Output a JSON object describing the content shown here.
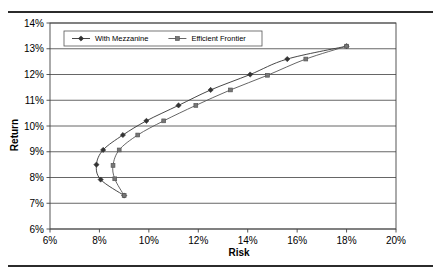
{
  "figure": {
    "has_top_rule": true,
    "has_bottom_rule": true,
    "rule_color": "#2b2b2b",
    "background": "#ffffff"
  },
  "chart_data": {
    "type": "line",
    "title": "",
    "xlabel": "Risk",
    "ylabel": "Return",
    "xlim": [
      6,
      20
    ],
    "ylim": [
      6,
      14
    ],
    "xticks": [
      6,
      8,
      10,
      12,
      14,
      16,
      18,
      20
    ],
    "xtick_labels": [
      "6%",
      "8%",
      "10%",
      "12%",
      "14%",
      "16%",
      "18%",
      "20%"
    ],
    "yticks": [
      6,
      7,
      8,
      9,
      10,
      11,
      12,
      13,
      14
    ],
    "ytick_labels": [
      "6%",
      "7%",
      "8%",
      "9%",
      "10%",
      "11%",
      "12%",
      "13%",
      "14%"
    ],
    "grid": "horizontal",
    "grid_color": "#555555",
    "legend_position": "top-left-inside",
    "units": "percent",
    "series": [
      {
        "name": "With Mezzanine",
        "marker": "diamond",
        "color": "#333333",
        "points": [
          {
            "x": 18.0,
            "y": 13.1
          },
          {
            "x": 15.6,
            "y": 12.6
          },
          {
            "x": 14.1,
            "y": 12.0
          },
          {
            "x": 12.5,
            "y": 11.4
          },
          {
            "x": 11.2,
            "y": 10.8
          },
          {
            "x": 9.9,
            "y": 10.2
          },
          {
            "x": 8.95,
            "y": 9.65
          },
          {
            "x": 8.15,
            "y": 9.07
          },
          {
            "x": 7.88,
            "y": 8.5
          },
          {
            "x": 8.05,
            "y": 7.92
          },
          {
            "x": 9.0,
            "y": 7.3
          }
        ]
      },
      {
        "name": "Efficient Frontier",
        "marker": "square",
        "color": "#555555",
        "points": [
          {
            "x": 18.0,
            "y": 13.1
          },
          {
            "x": 16.35,
            "y": 12.6
          },
          {
            "x": 14.8,
            "y": 11.97
          },
          {
            "x": 13.3,
            "y": 11.4
          },
          {
            "x": 11.9,
            "y": 10.8
          },
          {
            "x": 10.6,
            "y": 10.2
          },
          {
            "x": 9.55,
            "y": 9.65
          },
          {
            "x": 8.8,
            "y": 9.07
          },
          {
            "x": 8.55,
            "y": 8.47
          },
          {
            "x": 8.62,
            "y": 7.95
          },
          {
            "x": 9.0,
            "y": 7.3
          }
        ]
      }
    ]
  }
}
